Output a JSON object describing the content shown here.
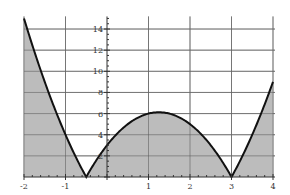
{
  "chart_data": {
    "type": "area",
    "title": "",
    "xlabel": "",
    "ylabel": "",
    "function": "|2x^2 - 5x - 3|",
    "xlim": [
      -2,
      4
    ],
    "ylim": [
      0,
      15
    ],
    "grid": true,
    "legend": null,
    "x_ticks": [
      "-2",
      "-1",
      "1",
      "2",
      "3",
      "4"
    ],
    "y_ticks": [
      "2",
      "4",
      "6",
      "8",
      "10",
      "12",
      "14"
    ],
    "x": [
      -2,
      -1.5,
      -1,
      -0.5,
      0,
      0.5,
      1,
      1.25,
      1.5,
      2,
      2.5,
      3,
      3.5,
      4
    ],
    "series": [
      {
        "name": "f(x)",
        "values": [
          15,
          8,
          4,
          0,
          3,
          5,
          6,
          6.125,
          6,
          5,
          3,
          0,
          4,
          9
        ]
      }
    ],
    "fill": "area between curve and x-axis shaded gray",
    "colors": {
      "fill": "#b8b8b8",
      "line": "#111111",
      "grid": "#888888"
    }
  }
}
